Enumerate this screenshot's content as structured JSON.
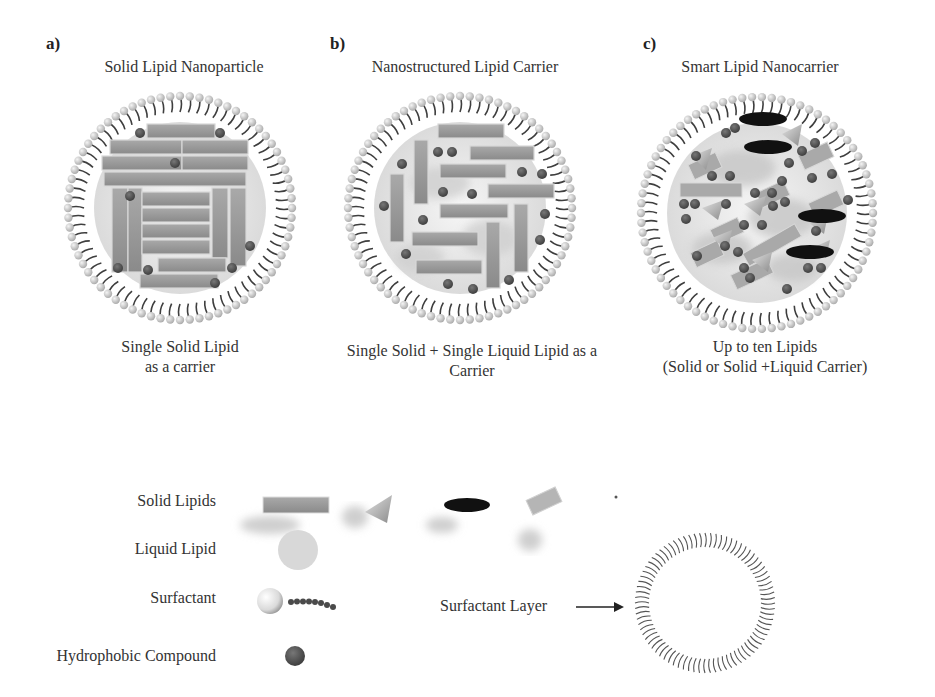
{
  "panels": [
    {
      "letter": "a)",
      "title": "Solid Lipid Nanoparticle",
      "caption_line1": "Single Solid Lipid",
      "caption_line2": "as a carrier"
    },
    {
      "letter": "b)",
      "title": "Nanostructured Lipid Carrier",
      "caption_line1": "Single Solid + Single Liquid Lipid as a",
      "caption_line2": "Carrier"
    },
    {
      "letter": "c)",
      "title": "Smart Lipid Nanocarrier",
      "caption_line1": "Up to ten Lipids",
      "caption_line2": "(Solid or Solid +Liquid Carrier)"
    }
  ],
  "legend": {
    "items": [
      {
        "label": "Solid Lipids",
        "icon": "solid-lipid-shapes-icon"
      },
      {
        "label": "Liquid Lipid",
        "icon": "liquid-lipid-blob-icon"
      },
      {
        "label": "Surfactant",
        "icon": "surfactant-molecule-icon"
      },
      {
        "label": "Hydrophobic Compound",
        "icon": "hydrophobic-compound-dot-icon"
      }
    ],
    "surfactant_layer_label": "Surfactant Layer"
  },
  "colors": {
    "solid_lipid": "#9a9a9a",
    "solid_lipid_dark": "#7d7d7d",
    "liquid_lipid": "#cfcfcf",
    "hydrophobic": "#555555",
    "ellipse": "#111111",
    "surfactant_head": "#d8d8d8",
    "surfactant_tail": "#444444"
  }
}
